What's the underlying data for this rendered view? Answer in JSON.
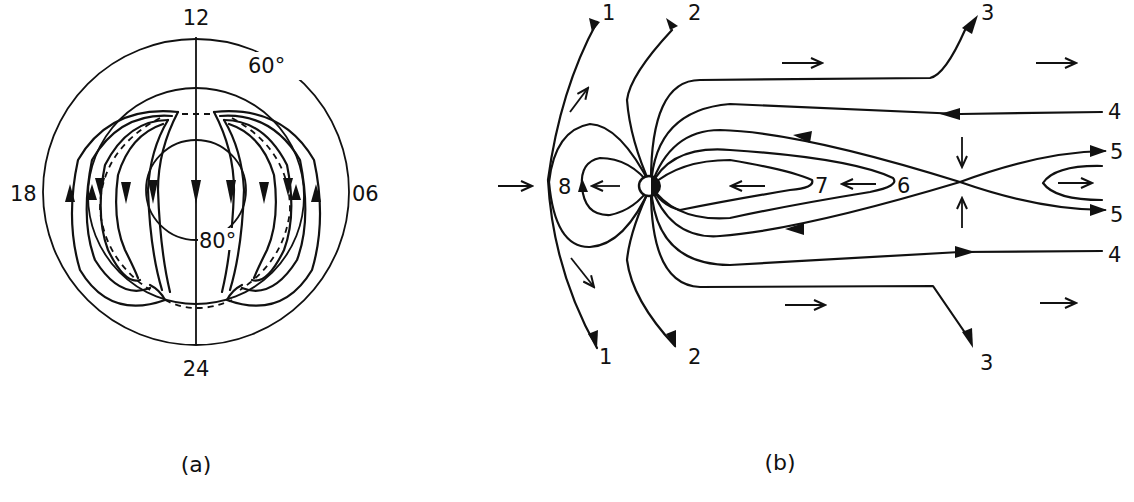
{
  "figure": {
    "panel_a": {
      "caption": "(a)",
      "local_time_labels": {
        "top": "12",
        "bottom": "24",
        "left": "18",
        "right": "06"
      },
      "latitude_labels": {
        "outer": "60°",
        "inner": "80°"
      },
      "description": "Polar ionospheric convection pattern: two-cell flow, antisunward over the polar cap, sunward return at lower latitudes"
    },
    "panel_b": {
      "caption": "(b)",
      "field_line_labels": {
        "line_1_top": "1",
        "line_1_bottom": "1",
        "line_2_top": "2",
        "line_2_bottom": "2",
        "line_3_top": "3",
        "line_3_bottom": "3",
        "line_4_top": "4",
        "line_4_bottom": "4",
        "line_5_top": "5",
        "line_5_bottom": "5",
        "line_6": "6",
        "line_7": "7",
        "line_8": "8"
      },
      "description": "Magnetospheric field line sequence during reconnection (Dungey cycle): solar wind from left, X-line in the tail"
    }
  },
  "colors": {
    "ink": "#111111",
    "background": "#ffffff"
  }
}
